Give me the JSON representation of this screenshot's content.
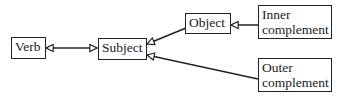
{
  "diagram": {
    "nodes": [
      {
        "id": "verb",
        "label": "Verb"
      },
      {
        "id": "subject",
        "label": "Subject"
      },
      {
        "id": "object",
        "label": "Object"
      },
      {
        "id": "inner",
        "label_line1": "Inner",
        "label_line2": "complement"
      },
      {
        "id": "outer",
        "label_line1": "Outer",
        "label_line2": "complement"
      }
    ],
    "edges": [
      {
        "from": "verb",
        "to": "subject",
        "type": "bidirectional",
        "arrowhead": "hollow-triangle"
      },
      {
        "from": "object",
        "to": "subject",
        "arrowhead": "hollow-triangle"
      },
      {
        "from": "outer",
        "to": "subject",
        "arrowhead": "hollow-triangle"
      },
      {
        "from": "inner",
        "to": "object",
        "arrowhead": "hollow-triangle"
      }
    ],
    "colors": {
      "stroke": "#222222",
      "background": "#ffffff",
      "text": "#1a1a1a"
    }
  }
}
